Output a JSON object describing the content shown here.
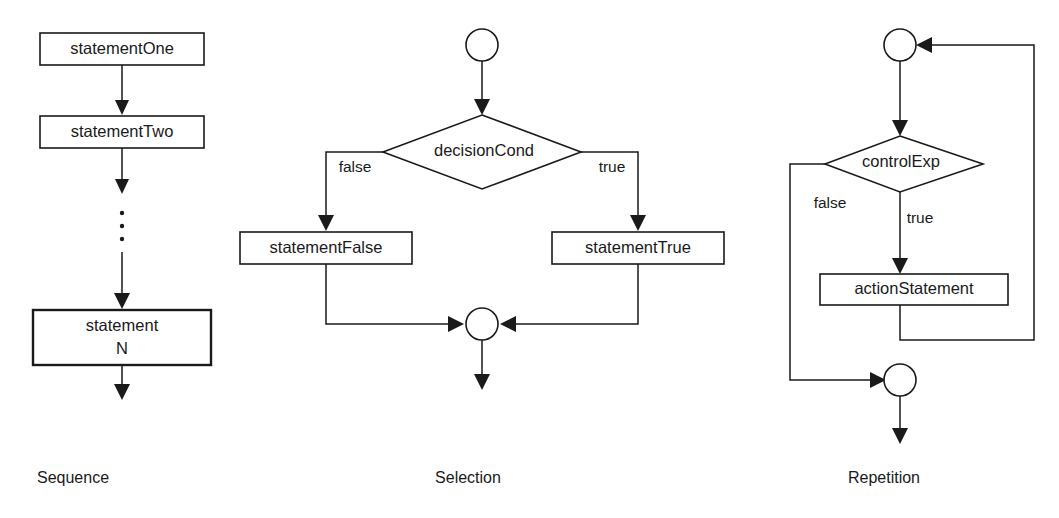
{
  "diagram": {
    "colors": {
      "stroke": "#1a1a1a",
      "fill": "#ffffff",
      "background": "#ffffff"
    },
    "panels": [
      {
        "id": "sequence",
        "caption": "Sequence",
        "nodes": [
          {
            "id": "seq-stmt-1",
            "type": "process",
            "label": "statementOne"
          },
          {
            "id": "seq-stmt-2",
            "type": "process",
            "label": "statementTwo"
          },
          {
            "id": "seq-ellipsis",
            "type": "vertical-ellipsis",
            "label": ""
          },
          {
            "id": "seq-stmt-n",
            "type": "process",
            "label_line1": "statement",
            "label_line2": "N"
          }
        ],
        "edges": [
          {
            "from": "seq-stmt-1",
            "to": "seq-stmt-2",
            "label": ""
          },
          {
            "from": "seq-stmt-2",
            "to": "seq-ellipsis",
            "label": ""
          },
          {
            "from": "seq-ellipsis",
            "to": "seq-stmt-n",
            "label": ""
          },
          {
            "from": "seq-stmt-n",
            "to": "exit",
            "label": ""
          }
        ]
      },
      {
        "id": "selection",
        "caption": "Selection",
        "nodes": [
          {
            "id": "sel-entry",
            "type": "connector-circle",
            "label": ""
          },
          {
            "id": "sel-decision",
            "type": "decision",
            "label": "decisionCond"
          },
          {
            "id": "sel-stmt-false",
            "type": "process",
            "label": "statementFalse"
          },
          {
            "id": "sel-stmt-true",
            "type": "process",
            "label": "statementTrue"
          },
          {
            "id": "sel-merge",
            "type": "connector-circle",
            "label": ""
          }
        ],
        "edges": [
          {
            "from": "sel-entry",
            "to": "sel-decision",
            "label": ""
          },
          {
            "from": "sel-decision",
            "to": "sel-stmt-false",
            "label": "false"
          },
          {
            "from": "sel-decision",
            "to": "sel-stmt-true",
            "label": "true"
          },
          {
            "from": "sel-stmt-false",
            "to": "sel-merge",
            "label": ""
          },
          {
            "from": "sel-stmt-true",
            "to": "sel-merge",
            "label": ""
          },
          {
            "from": "sel-merge",
            "to": "exit",
            "label": ""
          }
        ]
      },
      {
        "id": "repetition",
        "caption": "Repetition",
        "nodes": [
          {
            "id": "rep-entry",
            "type": "connector-circle",
            "label": ""
          },
          {
            "id": "rep-decision",
            "type": "decision",
            "label": "controlExp"
          },
          {
            "id": "rep-action",
            "type": "process",
            "label": "actionStatement"
          },
          {
            "id": "rep-exit",
            "type": "connector-circle",
            "label": ""
          }
        ],
        "edges": [
          {
            "from": "rep-entry",
            "to": "rep-decision",
            "label": ""
          },
          {
            "from": "rep-decision",
            "to": "rep-action",
            "label": "true"
          },
          {
            "from": "rep-decision",
            "to": "rep-exit",
            "label": "false"
          },
          {
            "from": "rep-action",
            "to": "rep-entry",
            "label": ""
          },
          {
            "from": "rep-exit",
            "to": "exit",
            "label": ""
          }
        ]
      }
    ],
    "labels": {
      "statement_one": "statementOne",
      "statement_two": "statementTwo",
      "statement_n_line1": "statement",
      "statement_n_line2": "N",
      "decision_cond": "decisionCond",
      "statement_false": "statementFalse",
      "statement_true": "statementTrue",
      "control_exp": "controlExp",
      "action_statement": "actionStatement",
      "false_1": "false",
      "true_1": "true",
      "false_2": "false",
      "true_2": "true",
      "caption_sequence": "Sequence",
      "caption_selection": "Selection",
      "caption_repetition": "Repetition"
    }
  }
}
